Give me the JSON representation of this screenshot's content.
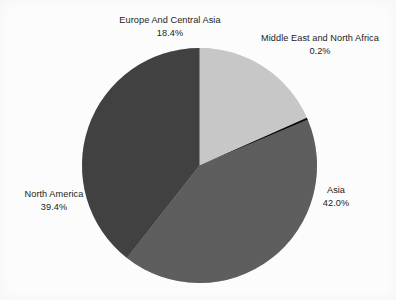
{
  "background_color": "#fdfdfd",
  "text_color": "#1c1c1c",
  "chart_data": {
    "type": "pie",
    "title": "",
    "subtitle": "",
    "xlabel": "",
    "ylabel": "",
    "legend_position": "none",
    "labels_position": "outside",
    "grid": false,
    "start_angle_deg": 0,
    "direction": "clockwise",
    "center": {
      "x": 199.5,
      "y": 165.5
    },
    "radius": 117.5,
    "categories": [
      "Europe And Central Asia",
      "Middle East and North Africa",
      "Asia",
      "North America"
    ],
    "values": [
      18.4,
      0.2,
      42.0,
      39.4
    ],
    "value_labels": [
      "18.4%",
      "0.2%",
      "42.0%",
      "39.4%"
    ],
    "units": "percent",
    "total": 100.0,
    "colors": [
      "#c8c8c8",
      "#0a0a0a",
      "#5e5e5e",
      "#414141"
    ],
    "slices": [
      {
        "name": "Europe And Central Asia",
        "value": 18.4,
        "value_label": "18.4%",
        "color": "#c8c8c8",
        "start_angle_deg": 0.0,
        "end_angle_deg": 66.24
      },
      {
        "name": "Middle East and North Africa",
        "value": 0.2,
        "value_label": "0.2%",
        "color": "#0a0a0a",
        "start_angle_deg": 66.24,
        "end_angle_deg": 66.96
      },
      {
        "name": "Asia",
        "value": 42.0,
        "value_label": "42.0%",
        "color": "#5e5e5e",
        "start_angle_deg": 66.96,
        "end_angle_deg": 218.16
      },
      {
        "name": "North America",
        "value": 39.4,
        "value_label": "39.4%",
        "color": "#414141",
        "start_angle_deg": 218.16,
        "end_angle_deg": 360.0
      }
    ]
  },
  "labels": {
    "europe": {
      "name": "Europe And Central Asia",
      "value": "18.4%"
    },
    "mena": {
      "name": "Middle East and North Africa",
      "value": "0.2%"
    },
    "north_america": {
      "name": "North America",
      "value": "39.4%"
    },
    "asia": {
      "name": "Asia",
      "value": "42.0%"
    }
  }
}
